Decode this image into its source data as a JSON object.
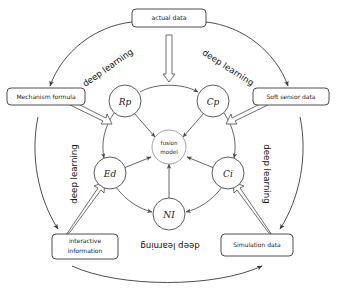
{
  "diagram": {
    "colors": {
      "stroke": "#3a3a3a",
      "inner_stroke": "#4a4a4a",
      "fusion_stroke": "#8a8a8a",
      "background": "#ffffff",
      "text": "#1a1a1a"
    },
    "outer_boxes": [
      {
        "id": "actual-data",
        "label": "actual data",
        "lines": [
          "actual data"
        ]
      },
      {
        "id": "mechanism-formula",
        "label": "Mechanism formula",
        "lines": [
          "Mechanism formula"
        ]
      },
      {
        "id": "soft-sensor-data",
        "label": "Soft sensor data",
        "lines": [
          "Soft sensor data"
        ]
      },
      {
        "id": "interactive-information",
        "label": "interactive information",
        "lines": [
          "interactive",
          "information"
        ]
      },
      {
        "id": "simulation-data",
        "label": "Simulation data",
        "lines": [
          "Simulation data"
        ]
      }
    ],
    "inner_nodes": [
      {
        "id": "rp",
        "label": "Rp"
      },
      {
        "id": "cp",
        "label": "Cp"
      },
      {
        "id": "ci",
        "label": "Ci"
      },
      {
        "id": "ni",
        "label": "NI"
      },
      {
        "id": "ed",
        "label": "Ed"
      }
    ],
    "center": {
      "id": "fusion-model",
      "label": "fusion model",
      "lines": [
        "fusion",
        "model"
      ]
    },
    "arc_labels": [
      {
        "id": "dl-top-left",
        "label": "deep learning",
        "rotation": -35
      },
      {
        "id": "dl-top-right",
        "label": "deep learning",
        "rotation": 33
      },
      {
        "id": "dl-left",
        "label": "deep learning",
        "rotation": -90
      },
      {
        "id": "dl-right",
        "label": "deep learning",
        "rotation": 90
      },
      {
        "id": "dl-bottom",
        "label": "deep learning",
        "rotation": 180
      }
    ]
  }
}
